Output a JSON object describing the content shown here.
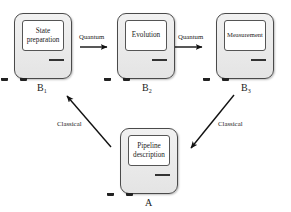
{
  "diagram": {
    "type": "pipeline-flow",
    "nodes": [
      {
        "id": "B1",
        "screen_text": "State preparation",
        "label": "B",
        "subscript": "1"
      },
      {
        "id": "B2",
        "screen_text": "Evolution",
        "label": "B",
        "subscript": "2"
      },
      {
        "id": "B3",
        "screen_text": "Measurement",
        "label": "B",
        "subscript": "3"
      },
      {
        "id": "A",
        "screen_text": "Pipeline description",
        "label": "A",
        "subscript": ""
      }
    ],
    "edges": [
      {
        "from": "B1",
        "to": "B2",
        "label": "Quantum"
      },
      {
        "from": "B2",
        "to": "B3",
        "label": "Quantum"
      },
      {
        "from": "A",
        "to": "B1",
        "label": "Classical"
      },
      {
        "from": "B3",
        "to": "A",
        "label": "Classical"
      }
    ],
    "colors": {
      "computer_body": "#e9e9e9",
      "outline": "#4a4a4a",
      "screen": "#ffffff",
      "arrow": "#111111"
    }
  }
}
